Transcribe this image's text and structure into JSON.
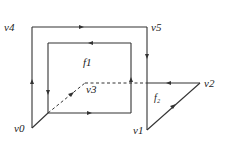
{
  "diagram": {
    "type": "planar graph with faces",
    "vertices": [
      {
        "id": "v0",
        "label": "v0",
        "x": 32,
        "y": 128
      },
      {
        "id": "v1",
        "label": "v1",
        "x": 147,
        "y": 130
      },
      {
        "id": "v2",
        "label": "v2",
        "x": 200,
        "y": 83
      },
      {
        "id": "v3",
        "label": "v3",
        "x": 85,
        "y": 83
      },
      {
        "id": "v4",
        "label": "v4",
        "x": 32,
        "y": 27
      },
      {
        "id": "v5",
        "label": "v5",
        "x": 147,
        "y": 27
      }
    ],
    "faces": [
      {
        "id": "f1",
        "label": "f1"
      },
      {
        "id": "f2",
        "label": "f₂"
      }
    ],
    "edges": [
      {
        "from": "v0",
        "to": "v4",
        "style": "solid",
        "arrow": "up"
      },
      {
        "from": "v4",
        "to": "v5",
        "style": "solid",
        "arrow": "right"
      },
      {
        "from": "v5",
        "to": "v1",
        "style": "solid",
        "arrow": "down"
      },
      {
        "from": "v1",
        "to": "v2",
        "style": "solid",
        "arrow": "up-right"
      },
      {
        "from": "v2",
        "to": "v3",
        "style": "solid-then-dashed",
        "arrow": "left"
      },
      {
        "from": "v0",
        "to": "inner-corner",
        "style": "solid"
      },
      {
        "from": "inner-corner",
        "to": "v3",
        "style": "dashed",
        "arrow": "up-right"
      },
      {
        "inner_loop": "f1 boundary",
        "direction": "counter-clockwise arrows: top left, left down, bottom right, right up"
      }
    ]
  }
}
